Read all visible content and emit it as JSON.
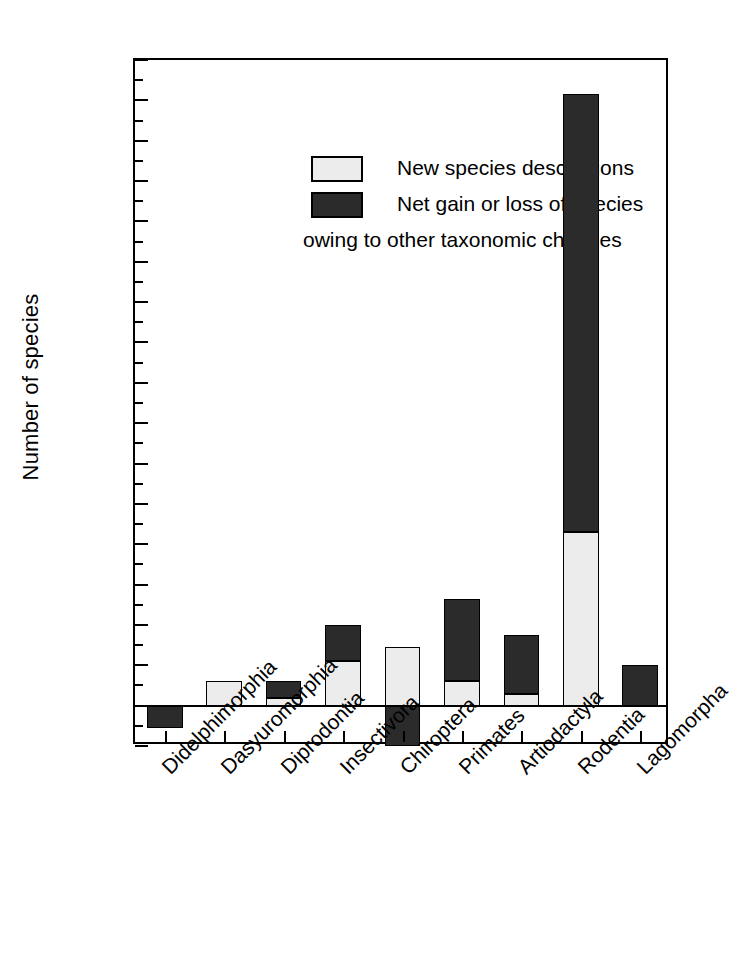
{
  "chart_data": {
    "type": "bar",
    "stacked": true,
    "title": "",
    "xlabel": "",
    "ylabel": "Number of species",
    "ylim": [
      -20,
      320
    ],
    "ytick_step": 20,
    "yticks": [
      -20,
      0,
      20,
      40,
      60,
      80,
      100,
      120,
      140,
      160,
      180,
      200,
      220,
      240,
      260,
      280,
      300,
      320
    ],
    "ytick_labels": [
      "-20",
      "0",
      "20",
      "40",
      "60",
      "80",
      "100",
      "120",
      "140",
      "160",
      "180",
      "200",
      "220",
      "240",
      "260",
      "280",
      "300",
      "320"
    ],
    "grid": false,
    "legend_position": "upper-left-inside",
    "categories": [
      "Didelphimorphia",
      "Dasyuromorphia",
      "Diprodontia",
      "Insectivora",
      "Chiroptera",
      "Primates",
      "Artiodactyla",
      "Rodentia",
      "Lagomorpha"
    ],
    "series": [
      {
        "name": "New species descriptions",
        "fill": "light-stipple",
        "color": "#ececec",
        "values": [
          0,
          12,
          4,
          22,
          29,
          12,
          6,
          86,
          0
        ]
      },
      {
        "name": "Net gain or loss of species owing to other taxonomic changes",
        "fill": "dark-stipple",
        "color": "#2b2b2b",
        "values": [
          -11,
          0,
          8,
          18,
          -20,
          41,
          29,
          217,
          20
        ]
      }
    ],
    "totals": [
      -11,
      12,
      12,
      40,
      9,
      53,
      35,
      303,
      20
    ]
  },
  "legend": {
    "items": [
      {
        "label": "New species descriptions",
        "swatch": "light"
      },
      {
        "label": "Net gain or loss of species",
        "label_line2": "owing to other taxonomic changes",
        "swatch": "dark"
      }
    ]
  },
  "axes": {
    "y_title": "Number of species"
  }
}
